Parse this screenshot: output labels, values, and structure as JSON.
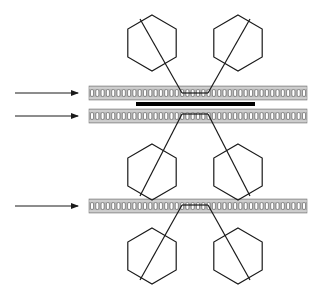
{
  "diagram": {
    "colors": {
      "background": "#ffffff",
      "line": "#1a1a1a",
      "strip_fill": "#b8b8b8",
      "strip_border": "#7a7a7a",
      "cell": "#ffffff",
      "bar": "#000000",
      "arrow": "#1a1a1a"
    },
    "arrows": [
      {
        "id": "arrow-1",
        "x1": 15,
        "x2": 78,
        "y": 93
      },
      {
        "id": "arrow-2",
        "x1": 15,
        "x2": 78,
        "y": 116
      },
      {
        "id": "arrow-3",
        "x1": 15,
        "x2": 78,
        "y": 206
      }
    ],
    "strips": [
      {
        "id": "strip-top",
        "x": 89,
        "y": 86,
        "width": 218,
        "height": 14
      },
      {
        "id": "strip-middle",
        "x": 89,
        "y": 109,
        "width": 218,
        "height": 14
      },
      {
        "id": "strip-bottom",
        "x": 89,
        "y": 199,
        "width": 218,
        "height": 14
      }
    ],
    "bar": {
      "x": 136,
      "y": 102,
      "width": 119,
      "height": 4
    },
    "hexagons": [
      {
        "id": "hex-top-left",
        "cx": 152,
        "cy": 43,
        "r": 28,
        "tether": {
          "from": [
            140,
            19
          ],
          "to": [
            182,
            93
          ]
        }
      },
      {
        "id": "hex-top-right",
        "cx": 238,
        "cy": 43,
        "r": 28,
        "tether": {
          "from": [
            250,
            19
          ],
          "to": [
            208,
            93
          ]
        }
      },
      {
        "id": "hex-mid-left",
        "cx": 152,
        "cy": 172,
        "r": 28,
        "tether": {
          "from": [
            140,
            196
          ],
          "to": [
            182,
            114
          ]
        }
      },
      {
        "id": "hex-mid-right",
        "cx": 238,
        "cy": 172,
        "r": 28,
        "tether": {
          "from": [
            250,
            196
          ],
          "to": [
            208,
            114
          ]
        }
      },
      {
        "id": "hex-bot-left",
        "cx": 152,
        "cy": 256,
        "r": 28,
        "tether": {
          "from": [
            140,
            280
          ],
          "to": [
            182,
            205
          ]
        }
      },
      {
        "id": "hex-bot-right",
        "cx": 238,
        "cy": 256,
        "r": 28,
        "tether": {
          "from": [
            250,
            280
          ],
          "to": [
            208,
            205
          ]
        }
      }
    ],
    "links": [
      {
        "id": "link-top",
        "x1": 182,
        "x2": 208,
        "y": 93
      },
      {
        "id": "link-middle",
        "x1": 182,
        "x2": 208,
        "y": 114
      },
      {
        "id": "link-bottom",
        "x1": 182,
        "x2": 208,
        "y": 205
      }
    ],
    "cell_pitch": 5.3
  }
}
